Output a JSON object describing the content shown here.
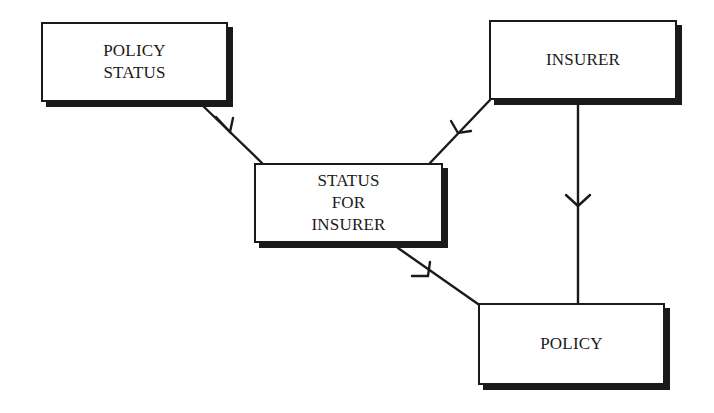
{
  "diagram": {
    "type": "entity-relationship",
    "notation": "crow's-foot style 'many' arrows (chevron toward many side)",
    "entities": [
      {
        "id": "policy_status",
        "label": "POLICY\nSTATUS",
        "x": 41,
        "y": 22,
        "w": 187,
        "h": 80
      },
      {
        "id": "insurer",
        "label": "INSURER",
        "x": 489,
        "y": 20,
        "w": 188,
        "h": 80
      },
      {
        "id": "status_for_insurer",
        "label": "STATUS\nFOR\nINSURER",
        "x": 254,
        "y": 163,
        "w": 189,
        "h": 80
      },
      {
        "id": "policy",
        "label": "POLICY",
        "x": 478,
        "y": 303,
        "w": 187,
        "h": 82
      }
    ],
    "relationships": [
      {
        "from": "policy_status",
        "to": "status_for_insurer",
        "cardinality": "one-to-many"
      },
      {
        "from": "insurer",
        "to": "status_for_insurer",
        "cardinality": "one-to-many"
      },
      {
        "from": "insurer",
        "to": "policy",
        "cardinality": "one-to-many"
      },
      {
        "from": "status_for_insurer",
        "to": "policy",
        "cardinality": "one-to-many"
      }
    ],
    "colors": {
      "stroke": "#1a1a1a",
      "fill": "#ffffff",
      "background": "#ffffff"
    }
  }
}
